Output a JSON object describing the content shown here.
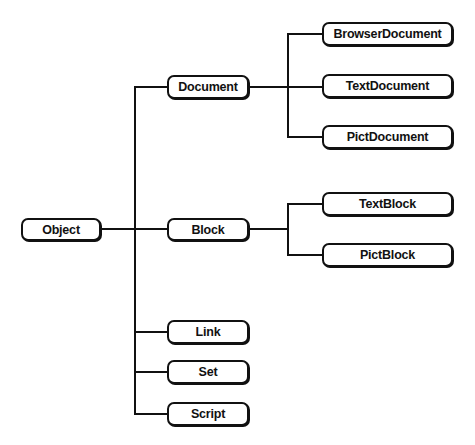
{
  "diagram": {
    "type": "class-hierarchy-tree",
    "nodes": [
      {
        "id": "object",
        "label": "Object",
        "x": 21,
        "y": 218,
        "w": 80,
        "h": 23
      },
      {
        "id": "document",
        "label": "Document",
        "x": 167,
        "y": 75,
        "w": 82,
        "h": 24
      },
      {
        "id": "block",
        "label": "Block",
        "x": 167,
        "y": 218,
        "w": 82,
        "h": 23
      },
      {
        "id": "link",
        "label": "Link",
        "x": 167,
        "y": 320,
        "w": 82,
        "h": 24
      },
      {
        "id": "set",
        "label": "Set",
        "x": 167,
        "y": 360,
        "w": 82,
        "h": 24
      },
      {
        "id": "script",
        "label": "Script",
        "x": 167,
        "y": 402,
        "w": 82,
        "h": 24
      },
      {
        "id": "browserdocument",
        "label": "BrowserDocument",
        "x": 322,
        "y": 22,
        "w": 131,
        "h": 24
      },
      {
        "id": "textdocument",
        "label": "TextDocument",
        "x": 322,
        "y": 74,
        "w": 131,
        "h": 24
      },
      {
        "id": "pictdocument",
        "label": "PictDocument",
        "x": 322,
        "y": 125,
        "w": 131,
        "h": 24
      },
      {
        "id": "textblock",
        "label": "TextBlock",
        "x": 322,
        "y": 192,
        "w": 131,
        "h": 24
      },
      {
        "id": "pictblock",
        "label": "PictBlock",
        "x": 322,
        "y": 243,
        "w": 131,
        "h": 24
      }
    ],
    "edges": [
      {
        "from": "object",
        "to": "document"
      },
      {
        "from": "object",
        "to": "block"
      },
      {
        "from": "object",
        "to": "link"
      },
      {
        "from": "object",
        "to": "set"
      },
      {
        "from": "object",
        "to": "script"
      },
      {
        "from": "document",
        "to": "browserdocument"
      },
      {
        "from": "document",
        "to": "textdocument"
      },
      {
        "from": "document",
        "to": "pictdocument"
      },
      {
        "from": "block",
        "to": "textblock"
      },
      {
        "from": "block",
        "to": "pictblock"
      }
    ]
  }
}
